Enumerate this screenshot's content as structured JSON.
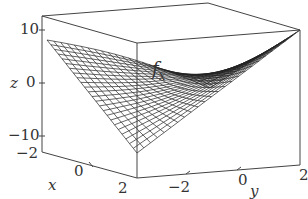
{
  "chart_data": {
    "type": "surface",
    "title": "",
    "annotation": "f_x",
    "xlabel": "x",
    "ylabel": "y",
    "zlabel": "z",
    "x_ticks": [
      "-2",
      "0",
      "2"
    ],
    "y_ticks": [
      "-2",
      "0",
      "2"
    ],
    "z_ticks": [
      "10",
      "0",
      "-10"
    ],
    "xlim": [
      -2,
      2
    ],
    "ylim": [
      -2,
      2
    ],
    "zlim": [
      -12,
      12
    ],
    "grid": false,
    "mesh": "wireframe",
    "corner_values": {
      "x=-2,y=-2": 8,
      "x=2,y=-2": -8,
      "x=-2,y=2": 0,
      "x=2,y=2": 8
    }
  },
  "labels": {
    "annotation_main": "f",
    "annotation_sub": "x",
    "z_axis": "z",
    "x_axis": "x",
    "y_axis": "y",
    "z_tick_10": "10",
    "z_tick_0": "0",
    "z_tick_neg10": "−10",
    "x_tick_neg2": "−2",
    "x_tick_0": "0",
    "x_tick_2": "2",
    "y_tick_neg2": "−2",
    "y_tick_0": "0",
    "y_tick_2": "2"
  },
  "colors": {
    "line": "#333333",
    "background": "#ffffff"
  }
}
